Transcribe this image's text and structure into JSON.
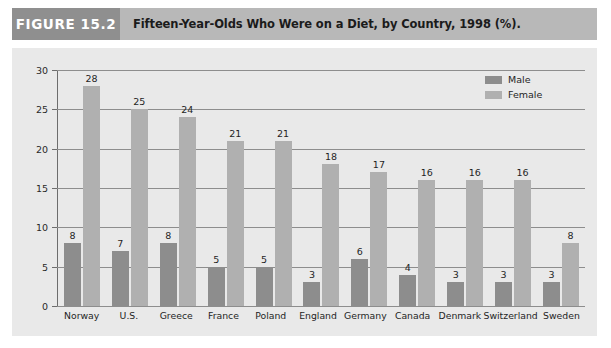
{
  "header": {
    "figure_tag": "FIGURE 15.2",
    "title": "Fifteen-Year-Olds Who Were on a Diet, by Country, 1998 (%)."
  },
  "colors": {
    "male_bar": "#8d8d8d",
    "female_bar": "#b0b0b0",
    "panel_bg": "#e9e9e9",
    "tag_bg": "#8f8f8f",
    "title_bg": "#b8b8b8",
    "gridline": "#8d8d8d"
  },
  "chart_data": {
    "type": "bar",
    "title": "Fifteen-Year-Olds Who Were on a Diet, by Country, 1998 (%).",
    "xlabel": "",
    "ylabel": "",
    "ylim": [
      0,
      30
    ],
    "yticks": [
      0,
      5,
      10,
      15,
      20,
      25,
      30
    ],
    "ytick_labels": [
      "0",
      "5",
      "10",
      "15",
      "20",
      "25",
      "30"
    ],
    "grid": true,
    "legend_position": "top-right",
    "categories": [
      "Norway",
      "U.S.",
      "Greece",
      "France",
      "Poland",
      "England",
      "Germany",
      "Canada",
      "Denmark",
      "Switzerland",
      "Sweden"
    ],
    "series": [
      {
        "name": "Male",
        "color": "#8d8d8d",
        "values": [
          8,
          7,
          8,
          5,
          5,
          3,
          6,
          4,
          3,
          3,
          3
        ]
      },
      {
        "name": "Female",
        "color": "#b0b0b0",
        "values": [
          28,
          25,
          24,
          21,
          21,
          18,
          17,
          16,
          16,
          16,
          8
        ]
      }
    ]
  }
}
